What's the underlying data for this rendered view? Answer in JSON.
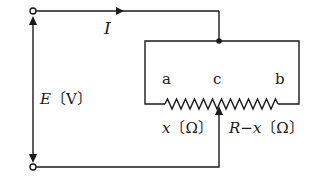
{
  "diagram": {
    "type": "circuit",
    "labels": {
      "current": "I",
      "emf": "E〔V〕",
      "node_a": "a",
      "node_c": "c",
      "node_b": "b",
      "resistance_left": "x〔Ω〕",
      "resistance_right": "R−x〔Ω〕"
    },
    "colors": {
      "line": "#1a1a1a",
      "background": "#ffffff"
    }
  }
}
